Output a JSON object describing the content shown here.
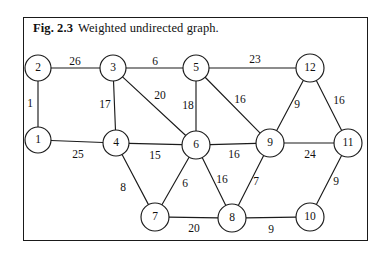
{
  "figure": {
    "caption_label": "Fig. 2.3",
    "caption_text": "Weighted undirected graph.",
    "frame_color": "#1a1a1a",
    "background_color": "#ffffff",
    "ink_color": "#1b1b1b"
  },
  "chart_data": {
    "type": "diagram",
    "graph_kind": "weighted undirected graph",
    "node_count": 12,
    "edge_count": 21,
    "nodes": [
      {
        "id": "1",
        "label": "1",
        "x": 38,
        "y": 140,
        "r": 13
      },
      {
        "id": "2",
        "label": "2",
        "x": 38,
        "y": 68,
        "r": 13
      },
      {
        "id": "3",
        "label": "3",
        "x": 113,
        "y": 68,
        "r": 13
      },
      {
        "id": "4",
        "label": "4",
        "x": 116,
        "y": 143,
        "r": 13
      },
      {
        "id": "5",
        "label": "5",
        "x": 196,
        "y": 68,
        "r": 13
      },
      {
        "id": "6",
        "label": "6",
        "x": 196,
        "y": 145,
        "r": 14
      },
      {
        "id": "7",
        "label": "7",
        "x": 155,
        "y": 217,
        "r": 14
      },
      {
        "id": "8",
        "label": "8",
        "x": 232,
        "y": 218,
        "r": 14
      },
      {
        "id": "9",
        "label": "9",
        "x": 270,
        "y": 143,
        "r": 14
      },
      {
        "id": "10",
        "label": "10",
        "x": 310,
        "y": 217,
        "r": 14
      },
      {
        "id": "11",
        "label": "11",
        "x": 348,
        "y": 143,
        "r": 14
      },
      {
        "id": "12",
        "label": "12",
        "x": 310,
        "y": 68,
        "r": 14
      }
    ],
    "edges": [
      {
        "source": "2",
        "target": "3",
        "weight": 26,
        "label_x": 75,
        "label_y": 62
      },
      {
        "source": "1",
        "target": "2",
        "weight": 1,
        "label_x": 30,
        "label_y": 104
      },
      {
        "source": "3",
        "target": "5",
        "weight": 6,
        "label_x": 155,
        "label_y": 62
      },
      {
        "source": "5",
        "target": "12",
        "weight": 23,
        "label_x": 255,
        "label_y": 60
      },
      {
        "source": "3",
        "target": "4",
        "weight": 17,
        "label_x": 105,
        "label_y": 105
      },
      {
        "source": "3",
        "target": "6",
        "weight": 20,
        "label_x": 160,
        "label_y": 96
      },
      {
        "source": "5",
        "target": "6",
        "weight": 18,
        "label_x": 188,
        "label_y": 106
      },
      {
        "source": "5",
        "target": "9",
        "weight": 16,
        "label_x": 240,
        "label_y": 100
      },
      {
        "source": "12",
        "target": "9",
        "weight": 9,
        "label_x": 297,
        "label_y": 105
      },
      {
        "source": "12",
        "target": "11",
        "weight": 16,
        "label_x": 339,
        "label_y": 101
      },
      {
        "source": "1",
        "target": "4",
        "weight": 25,
        "label_x": 78,
        "label_y": 155
      },
      {
        "source": "4",
        "target": "6",
        "weight": 15,
        "label_x": 155,
        "label_y": 156
      },
      {
        "source": "6",
        "target": "9",
        "weight": 16,
        "label_x": 234,
        "label_y": 155
      },
      {
        "source": "9",
        "target": "11",
        "weight": 24,
        "label_x": 310,
        "label_y": 155
      },
      {
        "source": "4",
        "target": "7",
        "weight": 8,
        "label_x": 123,
        "label_y": 188
      },
      {
        "source": "6",
        "target": "7",
        "weight": 6,
        "label_x": 185,
        "label_y": 184
      },
      {
        "source": "6",
        "target": "8",
        "weight": 16,
        "label_x": 222,
        "label_y": 180
      },
      {
        "source": "9",
        "target": "8",
        "weight": 7,
        "label_x": 256,
        "label_y": 182
      },
      {
        "source": "11",
        "target": "10",
        "weight": 9,
        "label_x": 336,
        "label_y": 182
      },
      {
        "source": "7",
        "target": "8",
        "weight": 20,
        "label_x": 194,
        "label_y": 229
      },
      {
        "source": "8",
        "target": "10",
        "weight": 9,
        "label_x": 271,
        "label_y": 230
      }
    ]
  }
}
